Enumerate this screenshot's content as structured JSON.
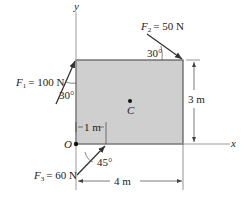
{
  "diagram": {
    "axes": {
      "x_label": "x",
      "y_label": "y"
    },
    "origin_label": "O",
    "centroid_label": "C",
    "plate": {
      "fill": "#cfcfcf",
      "stroke": "#555555",
      "width_label": "4 m",
      "height_label": "3 m"
    },
    "forces": [
      {
        "symbol": "F",
        "subscript": "1",
        "value": "= 100 N",
        "angle": "30°"
      },
      {
        "symbol": "F",
        "subscript": "2",
        "value": "= 50 N",
        "angle": "30°"
      },
      {
        "symbol": "F",
        "subscript": "3",
        "value": "= 60 N",
        "angle": "45°"
      }
    ],
    "dimensions": {
      "offset_1m": "1 m",
      "width": "4 m",
      "height": "3 m"
    },
    "colors": {
      "arrow": "#333333",
      "axis": "#888888",
      "plate": "#cfcfcf"
    }
  }
}
